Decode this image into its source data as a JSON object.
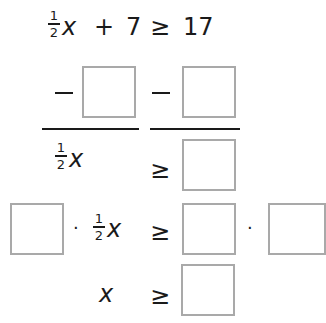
{
  "problem": {
    "equation": {
      "coefficient": {
        "numerator": "1",
        "denominator": "2"
      },
      "variable": "x",
      "plus": "+",
      "addend": "7",
      "relation": "≥",
      "rhs": "17"
    },
    "step_subtract": {
      "minus_left": "−",
      "minus_right": "−",
      "box_left_value": "",
      "box_right_value": ""
    },
    "step_result": {
      "coefficient": {
        "numerator": "1",
        "denominator": "2"
      },
      "variable": "x",
      "relation": "≥",
      "box_value": ""
    },
    "step_multiply": {
      "box_multiplier_left_value": "",
      "dot_left": "·",
      "coefficient": {
        "numerator": "1",
        "denominator": "2"
      },
      "variable": "x",
      "relation": "≥",
      "box_rhs_value": "",
      "dot_right": "·",
      "box_multiplier_right_value": ""
    },
    "step_final": {
      "variable": "x",
      "relation": "≥",
      "box_value": ""
    }
  },
  "colors": {
    "text": "#1a1a1a",
    "box_border": "#a9a9a9",
    "background": "#ffffff"
  }
}
